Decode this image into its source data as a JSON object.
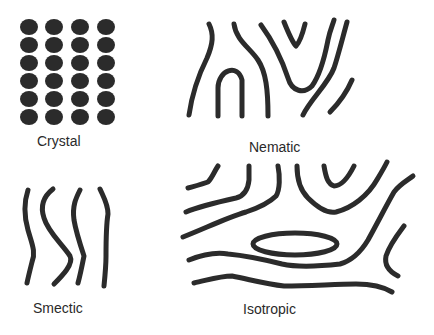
{
  "diagram": {
    "colors": {
      "ink": "#2b2b2b",
      "text": "#2a2a2a",
      "background": "#ffffff"
    },
    "panels": [
      {
        "id": "crystal",
        "label": "Crystal",
        "depiction": "4x6 grid of filled circles"
      },
      {
        "id": "nematic",
        "label": "Nematic",
        "depiction": "aligned wavy lines"
      },
      {
        "id": "smectic",
        "label": "Smectic",
        "depiction": "four roughly vertical wavy lines"
      },
      {
        "id": "isotropic",
        "label": "Isotropic",
        "depiction": "disordered curved lines and an ellipse"
      }
    ]
  }
}
